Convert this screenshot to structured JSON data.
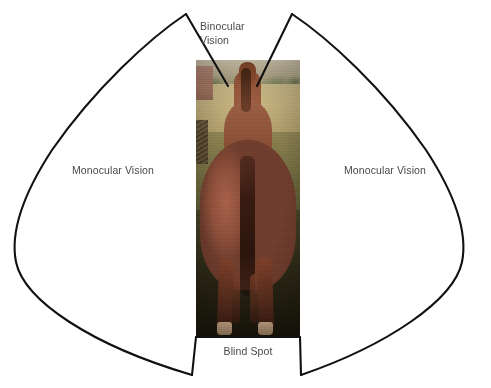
{
  "diagram": {
    "background_color": "#ffffff",
    "line_color": "#111111",
    "label_color": "#4a4a4a",
    "width": 491,
    "height": 388
  },
  "labels": {
    "monocular_left": "Monocular Vision",
    "monocular_right": "Monocular Vision",
    "binocular": "Binocular\nVision",
    "blind_spot": "Blind Spot"
  },
  "zones": [
    {
      "id": "monocular-left",
      "name": "Monocular Vision",
      "side": "left",
      "label_position": {
        "x": 53,
        "y": 164
      }
    },
    {
      "id": "monocular-right",
      "name": "Monocular Vision",
      "side": "right",
      "label_position": {
        "x": 325,
        "y": 164
      }
    },
    {
      "id": "binocular",
      "name": "Binocular Vision",
      "side": "front",
      "label_position": {
        "x": 200,
        "y": 20
      }
    },
    {
      "id": "blind-spot",
      "name": "Blind Spot",
      "side": "rear",
      "label_position": {
        "x": 196,
        "y": 345
      }
    }
  ],
  "photo": {
    "name": "horse-rear-view-photograph",
    "subject": "chestnut horse viewed from behind standing in a field",
    "x": 196,
    "y": 60,
    "width": 104,
    "height": 277
  }
}
